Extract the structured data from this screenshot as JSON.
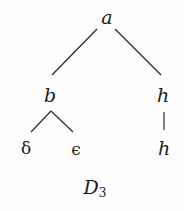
{
  "diagram": {
    "type": "tree",
    "caption": {
      "main": "D",
      "subscript": "3"
    },
    "nodes": [
      {
        "id": "a",
        "label": "a"
      },
      {
        "id": "b",
        "label": "b"
      },
      {
        "id": "h1",
        "label": "h"
      },
      {
        "id": "delta",
        "label": "δ"
      },
      {
        "id": "epsilon",
        "label": "ϵ"
      },
      {
        "id": "h2",
        "label": "h"
      }
    ],
    "edges": [
      {
        "from": "a",
        "to": "b"
      },
      {
        "from": "a",
        "to": "h1"
      },
      {
        "from": "b",
        "to": "delta"
      },
      {
        "from": "b",
        "to": "epsilon"
      },
      {
        "from": "h1",
        "to": "h2"
      }
    ],
    "colors": {
      "ink": "#1a1a1a",
      "background": "#fdfdfd"
    }
  }
}
